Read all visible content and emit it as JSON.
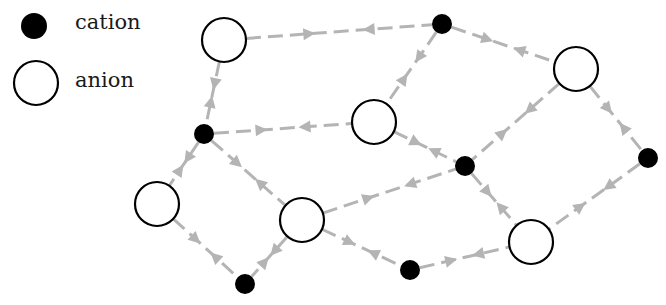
{
  "legend": {
    "items": [
      {
        "label": "cation",
        "type": "cation",
        "x": 34,
        "y": 26,
        "r": 13
      },
      {
        "label": "anion",
        "type": "anion",
        "x": 36,
        "y": 83,
        "r": 22
      }
    ]
  },
  "style": {
    "edge_color": "#b4b4b4",
    "cation_color": "#000000",
    "anion_fill": "#ffffff",
    "anion_stroke": "#000000"
  },
  "nodes": [
    {
      "id": "A1",
      "type": "anion",
      "x": 224,
      "y": 40
    },
    {
      "id": "C1",
      "type": "cation",
      "x": 442,
      "y": 24
    },
    {
      "id": "A2",
      "type": "anion",
      "x": 576,
      "y": 69
    },
    {
      "id": "C2",
      "type": "cation",
      "x": 204,
      "y": 134
    },
    {
      "id": "A3",
      "type": "anion",
      "x": 374,
      "y": 122
    },
    {
      "id": "C3",
      "type": "cation",
      "x": 465,
      "y": 166
    },
    {
      "id": "C4",
      "type": "cation",
      "x": 648,
      "y": 158
    },
    {
      "id": "A4",
      "type": "anion",
      "x": 157,
      "y": 204
    },
    {
      "id": "A5",
      "type": "anion",
      "x": 302,
      "y": 220
    },
    {
      "id": "A6",
      "type": "anion",
      "x": 531,
      "y": 242
    },
    {
      "id": "C5",
      "type": "cation",
      "x": 410,
      "y": 270
    },
    {
      "id": "C6",
      "type": "cation",
      "x": 245,
      "y": 284
    }
  ],
  "edges": [
    [
      "A1",
      "C1"
    ],
    [
      "C1",
      "A2"
    ],
    [
      "C1",
      "A3"
    ],
    [
      "A1",
      "C2"
    ],
    [
      "C2",
      "A3"
    ],
    [
      "A3",
      "C3"
    ],
    [
      "A2",
      "C3"
    ],
    [
      "A2",
      "C4"
    ],
    [
      "C2",
      "A4"
    ],
    [
      "C2",
      "A5"
    ],
    [
      "A5",
      "C3"
    ],
    [
      "C3",
      "A6"
    ],
    [
      "C4",
      "A6"
    ],
    [
      "A4",
      "C6"
    ],
    [
      "A5",
      "C6"
    ],
    [
      "A5",
      "C5"
    ],
    [
      "C5",
      "A6"
    ]
  ],
  "sizes": {
    "anion_r": 22,
    "cation_r": 10
  }
}
